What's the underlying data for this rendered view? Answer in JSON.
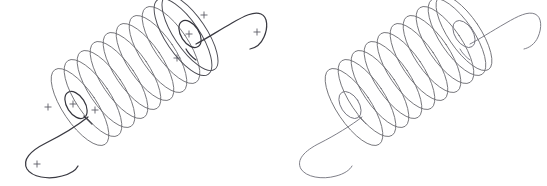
{
  "figure": {
    "name": "helical-coil-pair-diagram",
    "background_color": "#ffffff",
    "width": 547,
    "height": 186,
    "line_color_coil": "#6e6e74",
    "line_color_lead": "#3a3a42",
    "cross_color": "#56565e",
    "panels": [
      {
        "id": "left-coil",
        "label": "",
        "annotated": true,
        "turns": 10,
        "axis": {
          "start_x": 70,
          "start_y": 130,
          "end_x": 200,
          "end_y": 40
        },
        "radius_x": 17,
        "radius_y": 45,
        "tilt_degrees": -34,
        "crosses": [
          {
            "x": 204,
            "y": 15
          },
          {
            "x": 189,
            "y": 34
          },
          {
            "x": 257,
            "y": 32
          },
          {
            "x": 177,
            "y": 58
          },
          {
            "x": 48,
            "y": 107
          },
          {
            "x": 73,
            "y": 104
          },
          {
            "x": 95,
            "y": 110
          },
          {
            "x": 37,
            "y": 164
          }
        ]
      },
      {
        "id": "right-coil",
        "label": "",
        "annotated": false,
        "turns": 10,
        "axis": {
          "start_x": 344,
          "start_y": 130,
          "end_x": 474,
          "end_y": 40
        },
        "radius_x": 17,
        "radius_y": 45,
        "tilt_degrees": -34,
        "crosses": []
      }
    ]
  }
}
